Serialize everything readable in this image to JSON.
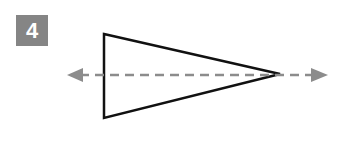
{
  "badge": {
    "number": "4",
    "background": "#858585",
    "text_color": "#ffffff"
  },
  "figure": {
    "shape": "triangle",
    "stroke_color": "#111111",
    "axis_color": "#8c8c8c",
    "vertices": [
      [
        104,
        34
      ],
      [
        280,
        74
      ],
      [
        104,
        118
      ]
    ],
    "axis": {
      "y": 75,
      "x_start": 68,
      "x_end": 327,
      "style": "dashed",
      "arrowheads": "both"
    }
  }
}
